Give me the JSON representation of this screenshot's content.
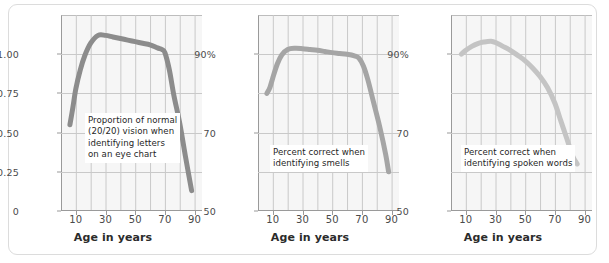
{
  "figure": {
    "panels": [
      {
        "id": "vision",
        "annotation": "Proportion of normal\n(20/20) vision when\nidentifying letters\non an eye chart",
        "xlabel": "Age in years",
        "xticks": [
          "10",
          "30",
          "50",
          "70",
          "90"
        ],
        "yticks": [
          "1.00",
          "0.75",
          "0.50",
          "0.25",
          "0"
        ],
        "line_color": "#8c8c8c"
      },
      {
        "id": "smell",
        "annotation": "Percent correct when\nidentifying smells",
        "xlabel": "Age in years",
        "xticks": [
          "10",
          "30",
          "50",
          "70",
          "90"
        ],
        "yticks": [
          "90%",
          "70",
          "50"
        ],
        "line_color": "#a5a5a5"
      },
      {
        "id": "hearing",
        "annotation": "Percent correct when\nidentifying spoken words",
        "xlabel": "Age in years",
        "xticks": [
          "10",
          "30",
          "50",
          "70",
          "90"
        ],
        "yticks": [
          "90%",
          "70",
          "50"
        ],
        "line_color": "#c4c4c4"
      }
    ]
  },
  "chart_data": [
    {
      "type": "line",
      "title": "",
      "xlabel": "Age in years",
      "ylabel": "",
      "annotation": "Proportion of normal (20/20) vision when identifying letters on an eye chart",
      "xlim": [
        0,
        95
      ],
      "ylim": [
        0,
        1.25
      ],
      "xticks": [
        10,
        30,
        50,
        70,
        90
      ],
      "yticks": [
        0,
        0.25,
        0.5,
        0.75,
        1.0
      ],
      "ytick_labels": [
        "0",
        "0.25",
        "0.50",
        "0.75",
        "1.00"
      ],
      "grid": true,
      "legend": "none",
      "series": [
        {
          "name": "Proportion of normal (20/20) vision",
          "x": [
            6,
            8,
            10,
            13,
            16,
            20,
            25,
            30,
            35,
            40,
            45,
            50,
            55,
            60,
            65,
            68,
            70,
            73,
            76,
            80,
            84,
            88
          ],
          "values": [
            0.55,
            0.66,
            0.78,
            0.9,
            0.99,
            1.07,
            1.12,
            1.12,
            1.11,
            1.1,
            1.09,
            1.08,
            1.07,
            1.06,
            1.04,
            1.03,
            1.01,
            0.9,
            0.74,
            0.56,
            0.34,
            0.13
          ]
        }
      ]
    },
    {
      "type": "line",
      "title": "",
      "xlabel": "Age in years",
      "ylabel": "",
      "annotation": "Percent correct when identifying smells",
      "xlim": [
        0,
        95
      ],
      "ylim": [
        50,
        100
      ],
      "xticks": [
        10,
        30,
        50,
        70,
        90
      ],
      "yticks": [
        50,
        70,
        90
      ],
      "ytick_labels": [
        "50",
        "70",
        "90%"
      ],
      "grid": true,
      "legend": "none",
      "series": [
        {
          "name": "Percent correct identifying smells",
          "x": [
            6,
            8,
            10,
            13,
            16,
            20,
            25,
            30,
            35,
            40,
            45,
            50,
            55,
            60,
            65,
            68,
            71,
            74,
            78,
            82,
            86,
            88
          ],
          "values": [
            80.0,
            81.5,
            84.0,
            87.5,
            89.8,
            91.2,
            91.5,
            91.4,
            91.2,
            91.0,
            90.7,
            90.4,
            90.2,
            90.0,
            89.6,
            89.0,
            87.0,
            83.5,
            77.5,
            71.5,
            64.5,
            60.0
          ]
        }
      ]
    },
    {
      "type": "line",
      "title": "",
      "xlabel": "Age in years",
      "ylabel": "",
      "annotation": "Percent correct when identifying spoken words",
      "xlim": [
        0,
        95
      ],
      "ylim": [
        50,
        100
      ],
      "xticks": [
        10,
        30,
        50,
        70,
        90
      ],
      "yticks": [
        50,
        70,
        90
      ],
      "ytick_labels": [
        "50",
        "70",
        "90%"
      ],
      "grid": true,
      "legend": "none",
      "series": [
        {
          "name": "Percent correct identifying spoken words",
          "x": [
            7,
            10,
            14,
            18,
            22,
            27,
            31,
            35,
            40,
            45,
            50,
            55,
            60,
            65,
            70,
            74,
            78,
            82,
            85
          ],
          "values": [
            90.0,
            91.0,
            92.0,
            92.7,
            93.1,
            93.3,
            92.8,
            92.0,
            91.0,
            89.7,
            88.3,
            86.5,
            84.3,
            81.5,
            77.5,
            73.0,
            68.5,
            64.0,
            62.0
          ]
        }
      ]
    }
  ]
}
